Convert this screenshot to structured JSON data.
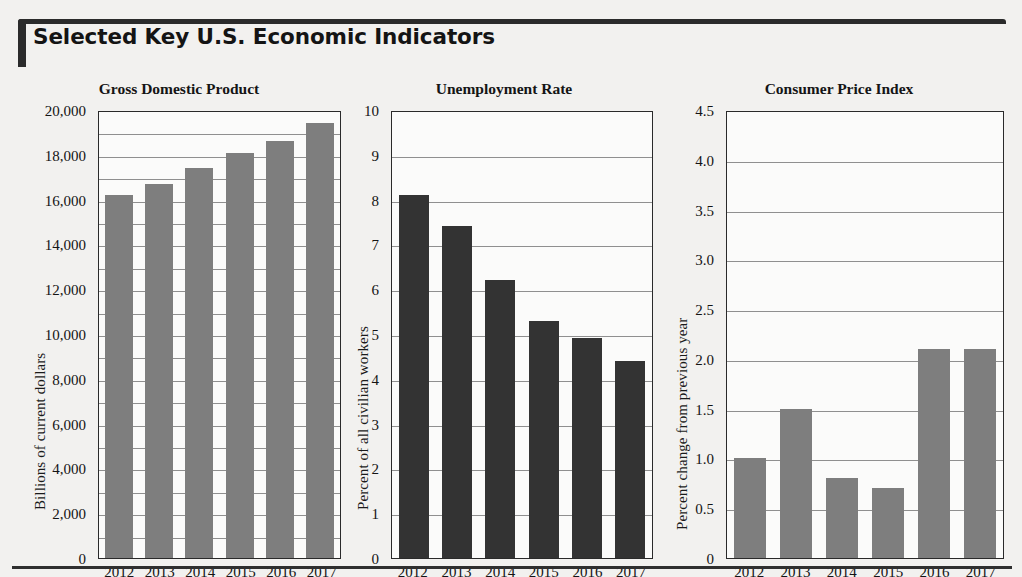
{
  "header": {
    "title": "Selected Key U.S. Economic Indicators"
  },
  "chart_data": [
    {
      "type": "bar",
      "title": "Gross Domestic Product",
      "xlabel": "",
      "ylabel": "Billions of current dollars",
      "categories": [
        "2012",
        "2013",
        "2014",
        "2015",
        "2016",
        "2017"
      ],
      "values": [
        16200,
        16700,
        17400,
        18100,
        18600,
        19400
      ],
      "ylim": [
        0,
        20000
      ],
      "ytick_step": 2000,
      "gridline_step": 1000,
      "ytick_labels": [
        "20,000",
        "18,000",
        "16,000",
        "14,000",
        "12,000",
        "10,000",
        "8,000",
        "6,000",
        "4,000",
        "2,000",
        "0"
      ],
      "bar_color": "#7e7e7e",
      "grid": true,
      "legend": "none"
    },
    {
      "type": "bar",
      "title": "Unemployment Rate",
      "xlabel": "",
      "ylabel": "Percent of all civilian workers",
      "categories": [
        "2012",
        "2013",
        "2014",
        "2015",
        "2016",
        "2017"
      ],
      "values": [
        8.1,
        7.4,
        6.2,
        5.3,
        4.9,
        4.4
      ],
      "ylim": [
        0,
        10
      ],
      "ytick_step": 1,
      "gridline_step": 1,
      "ytick_labels": [
        "10",
        "9",
        "8",
        "7",
        "6",
        "5",
        "4",
        "3",
        "2",
        "1",
        "0"
      ],
      "bar_color": "#333333",
      "grid": true,
      "legend": "none"
    },
    {
      "type": "bar",
      "title": "Consumer Price Index",
      "xlabel": "",
      "ylabel": "Percent change from previous year",
      "categories": [
        "2012",
        "2013",
        "2014",
        "2015",
        "2016",
        "2017"
      ],
      "values": [
        1.0,
        1.5,
        0.8,
        0.7,
        2.1,
        2.1
      ],
      "ylim": [
        0,
        4.5
      ],
      "ytick_step": 0.5,
      "gridline_step": 0.5,
      "ytick_labels": [
        "4.5",
        "4.0",
        "3.5",
        "3.0",
        "2.5",
        "2.0",
        "1.5",
        "1.0",
        "0.5",
        "0"
      ],
      "bar_color": "#7e7e7e",
      "grid": true,
      "legend": "none"
    }
  ]
}
